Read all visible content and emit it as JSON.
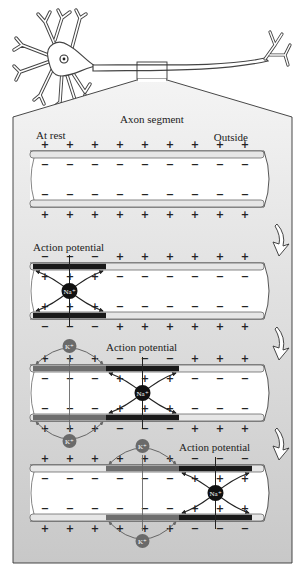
{
  "title": "Axon segment",
  "labels": {
    "at_rest": "At rest",
    "outside": "Outside",
    "inside": "Inside",
    "action_potential": "Action potential"
  },
  "symbols": {
    "plus": "+",
    "minus": "−",
    "sodium": "Na⁺",
    "potassium": "K⁺"
  },
  "colors": {
    "membrane_rest": "#e6e6e6",
    "membrane_depolarized": "#1a1a1a",
    "membrane_repolarizing": "#6e6e6e",
    "sodium_ion": "#111111",
    "potassium_ion": "#6a6a6a",
    "panel_top": "#f4f4f4",
    "panel_bottom": "#c8c8c8"
  },
  "stages": [
    {
      "name": "at-rest",
      "label_key": "at_rest",
      "ap_position": null,
      "k_position": null
    },
    {
      "name": "stage-2",
      "label_key": "action_potential",
      "ap_position": 1,
      "k_position": null
    },
    {
      "name": "stage-3",
      "label_key": "action_potential",
      "ap_position": 2,
      "k_position": 1
    },
    {
      "name": "stage-4",
      "label_key": "action_potential",
      "ap_position": 3,
      "k_position": 2
    }
  ]
}
